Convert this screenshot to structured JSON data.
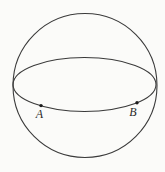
{
  "figure": {
    "kind": "sphere-with-equator-diagram",
    "labels": {
      "point_a": "A",
      "point_b": "B"
    },
    "colors": {
      "line": "#3a3a3a",
      "point": "#1c1c1c",
      "label_text": "#2a2a2a",
      "background": "#fbfbf9"
    }
  }
}
